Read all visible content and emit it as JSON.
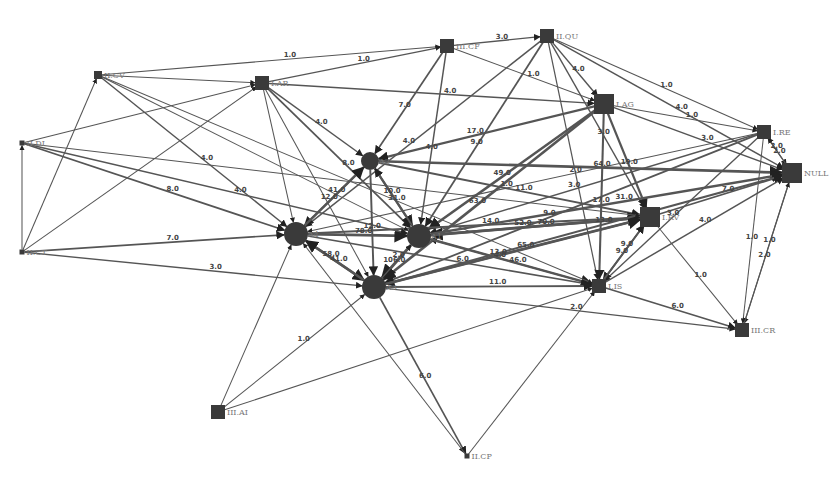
{
  "colors": {
    "node": "#3a3a3a",
    "edge": "#555555",
    "node_label": "#777777",
    "edge_label": "#444444",
    "background": "#ffffff"
  },
  "nodes": [
    {
      "id": "II.CV",
      "label": "II.CV",
      "shape": "square",
      "size": "small"
    },
    {
      "id": "I.AR",
      "label": "I.AR",
      "shape": "square",
      "size": "medium"
    },
    {
      "id": "III.CF",
      "label": "III.CF",
      "shape": "square",
      "size": "medium"
    },
    {
      "id": "II.QU",
      "label": "II.QU",
      "shape": "square",
      "size": "medium"
    },
    {
      "id": "I.AG",
      "label": "I.AG",
      "shape": "square",
      "size": "large"
    },
    {
      "id": "I.RE",
      "label": "I.RE",
      "shape": "square",
      "size": "medium"
    },
    {
      "id": "NULL",
      "label": "NULL",
      "shape": "square",
      "size": "large"
    },
    {
      "id": "II.DI",
      "label": "II.DI",
      "shape": "square",
      "size": "tiny"
    },
    {
      "id": "II.CT",
      "label": "II.CT",
      "shape": "square",
      "size": "tiny"
    },
    {
      "id": "A2",
      "label": "A2",
      "shape": "circle",
      "size": "medium"
    },
    {
      "id": "A4",
      "label": "A4",
      "shape": "circle",
      "size": "large"
    },
    {
      "id": "A1",
      "label": "A1",
      "shape": "circle",
      "size": "large"
    },
    {
      "id": "A3",
      "label": "A3",
      "shape": "circle",
      "size": "large"
    },
    {
      "id": "I.RV",
      "label": "I.RV",
      "shape": "square",
      "size": "large"
    },
    {
      "id": "I.IS",
      "label": "I.IS",
      "shape": "square",
      "size": "medium"
    },
    {
      "id": "III.CR",
      "label": "III.CR",
      "shape": "square",
      "size": "medium"
    },
    {
      "id": "III.AI",
      "label": "III.AI",
      "shape": "square",
      "size": "medium"
    },
    {
      "id": "II.CP",
      "label": "II.CP",
      "shape": "square",
      "size": "tiny"
    }
  ],
  "edges": [
    {
      "from": "II.CV",
      "to": "I.AR",
      "weight": ""
    },
    {
      "from": "II.CV",
      "to": "III.CF",
      "weight": "1.0"
    },
    {
      "from": "I.AR",
      "to": "III.CF",
      "weight": "1.0"
    },
    {
      "from": "I.AR",
      "to": "I.AG",
      "weight": "4.0"
    },
    {
      "from": "I.AR",
      "to": "A1",
      "weight": "8.0"
    },
    {
      "from": "I.AR",
      "to": "A2",
      "weight": "4.0"
    },
    {
      "from": "I.AR",
      "to": "A4",
      "weight": ""
    },
    {
      "from": "I.AR",
      "to": "A3",
      "weight": ""
    },
    {
      "from": "III.CF",
      "to": "II.QU",
      "weight": "3.0"
    },
    {
      "from": "III.CF",
      "to": "A2",
      "weight": "7.0"
    },
    {
      "from": "III.CF",
      "to": "A1",
      "weight": "4.0"
    },
    {
      "from": "III.CF",
      "to": "I.AG",
      "weight": "1.0"
    },
    {
      "from": "II.QU",
      "to": "I.AG",
      "weight": "4.0"
    },
    {
      "from": "II.QU",
      "to": "I.RE",
      "weight": "1.0"
    },
    {
      "from": "II.QU",
      "to": "A1",
      "weight": "9.0"
    },
    {
      "from": "II.QU",
      "to": "A4",
      "weight": "4.0"
    },
    {
      "from": "II.QU",
      "to": "I.RV",
      "weight": "3.0"
    },
    {
      "from": "II.QU",
      "to": "I.IS",
      "weight": "2.0"
    },
    {
      "from": "II.QU",
      "to": "NULL",
      "weight": "4.0"
    },
    {
      "from": "I.AG",
      "to": "I.RE",
      "weight": "1.0"
    },
    {
      "from": "I.AG",
      "to": "NULL",
      "weight": "3.0"
    },
    {
      "from": "I.AG",
      "to": "I.RV",
      "weight": "19.0"
    },
    {
      "from": "I.AG",
      "to": "I.IS",
      "weight": "17.0"
    },
    {
      "from": "I.AG",
      "to": "A1",
      "weight": "49.0"
    },
    {
      "from": "I.AG",
      "to": "A3",
      "weight": "63.0"
    },
    {
      "from": "I.AG",
      "to": "A2",
      "weight": "17.0"
    },
    {
      "from": "I.RE",
      "to": "NULL",
      "weight": "2.0"
    },
    {
      "from": "I.RE",
      "to": "A1",
      "weight": "3.0"
    },
    {
      "from": "I.RE",
      "to": "A3",
      "weight": "9.0"
    },
    {
      "from": "I.RE",
      "to": "I.IS",
      "weight": "3.0"
    },
    {
      "from": "I.RE",
      "to": "A4",
      "weight": "1.0"
    },
    {
      "from": "I.RE",
      "to": "III.CR",
      "weight": "1.0"
    },
    {
      "from": "NULL",
      "to": "I.RE",
      "weight": "2.0"
    },
    {
      "from": "NULL",
      "to": "III.CR",
      "weight": "2.0"
    },
    {
      "from": "III.CR",
      "to": "NULL",
      "weight": "1.0"
    },
    {
      "from": "I.RV",
      "to": "NULL",
      "weight": "7.0"
    },
    {
      "from": "I.RV",
      "to": "III.CR",
      "weight": "1.0"
    },
    {
      "from": "I.RV",
      "to": "I.IS",
      "weight": "9.0"
    },
    {
      "from": "I.RV",
      "to": "A1",
      "weight": "52.0"
    },
    {
      "from": "I.RV",
      "to": "A3",
      "weight": "13.0"
    },
    {
      "from": "I.IS",
      "to": "NULL",
      "weight": "4.0"
    },
    {
      "from": "I.IS",
      "to": "III.CR",
      "weight": "6.0"
    },
    {
      "from": "I.IS",
      "to": "I.RV",
      "weight": "9.0"
    },
    {
      "from": "I.IS",
      "to": "A1",
      "weight": "4.0"
    },
    {
      "from": "A2",
      "to": "A1",
      "weight": "31.0"
    },
    {
      "from": "A2",
      "to": "A4",
      "weight": "12.0"
    },
    {
      "from": "A2",
      "to": "A3",
      "weight": "12.0"
    },
    {
      "from": "A2",
      "to": "I.RV",
      "weight": "11.0"
    },
    {
      "from": "A2",
      "to": "NULL",
      "weight": "64.0"
    },
    {
      "from": "A4",
      "to": "A2",
      "weight": "41.0"
    },
    {
      "from": "A4",
      "to": "A1",
      "weight": "78.0"
    },
    {
      "from": "A4",
      "to": "A3",
      "weight": "41.0"
    },
    {
      "from": "A4",
      "to": "I.RV",
      "weight": "14.0"
    },
    {
      "from": "A4",
      "to": "I.IS",
      "weight": "6.0"
    },
    {
      "from": "A1",
      "to": "A2",
      "weight": "10.0"
    },
    {
      "from": "A1",
      "to": "A3",
      "weight": "106.0"
    },
    {
      "from": "A1",
      "to": "I.RV",
      "weight": "70.0"
    },
    {
      "from": "A1",
      "to": "NULL",
      "weight": "31.0"
    },
    {
      "from": "A1",
      "to": "I.IS",
      "weight": "46.0"
    },
    {
      "from": "A3",
      "to": "A4",
      "weight": "58.0"
    },
    {
      "from": "A3",
      "to": "A1",
      "weight": "2.0"
    },
    {
      "from": "A3",
      "to": "I.RV",
      "weight": "65.0"
    },
    {
      "from": "A3",
      "to": "NULL",
      "weight": "13.0"
    },
    {
      "from": "A3",
      "to": "I.IS",
      "weight": "11.0"
    },
    {
      "from": "A3",
      "to": "III.CR",
      "weight": "2.0"
    },
    {
      "from": "A3",
      "to": "II.CP",
      "weight": "6.0"
    },
    {
      "from": "III.AI",
      "to": "A3",
      "weight": "1.0"
    },
    {
      "from": "III.AI",
      "to": "I.IS",
      "weight": ""
    },
    {
      "from": "III.AI",
      "to": "A4",
      "weight": ""
    },
    {
      "from": "II.CT",
      "to": "A4",
      "weight": "7.0"
    },
    {
      "from": "II.CT",
      "to": "A3",
      "weight": "3.0"
    },
    {
      "from": "II.CT",
      "to": "II.DI",
      "weight": ""
    },
    {
      "from": "II.CT",
      "to": "I.AR",
      "weight": ""
    },
    {
      "from": "II.CT",
      "to": "II.CV",
      "weight": ""
    },
    {
      "from": "II.DI",
      "to": "A4",
      "weight": "8.0"
    },
    {
      "from": "II.DI",
      "to": "I.AR",
      "weight": ""
    },
    {
      "from": "II.DI",
      "to": "A1",
      "weight": "4.0"
    },
    {
      "from": "II.DI",
      "to": "I.RV",
      "weight": ""
    },
    {
      "from": "II.CV",
      "to": "A4",
      "weight": "4.0"
    },
    {
      "from": "II.CV",
      "to": "I.IS",
      "weight": ""
    },
    {
      "from": "II.CV",
      "to": "A1",
      "weight": ""
    },
    {
      "from": "II.CP",
      "to": "I.IS",
      "weight": ""
    },
    {
      "from": "II.CP",
      "to": "A4",
      "weight": ""
    }
  ]
}
